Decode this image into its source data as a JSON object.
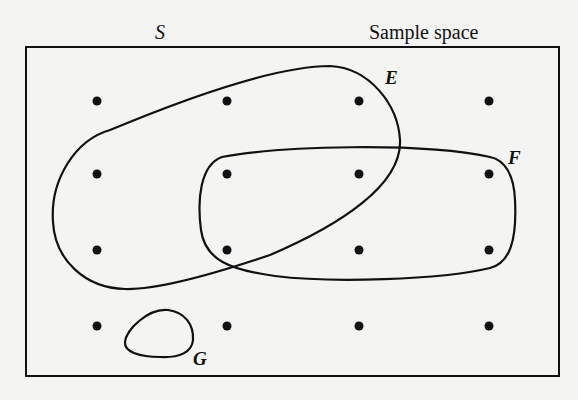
{
  "diagram": {
    "type": "venn",
    "labels": {
      "universe": "S",
      "universe_caption": "Sample space",
      "set_e": "E",
      "set_f": "F",
      "set_g": "G"
    },
    "colors": {
      "background": "#f4f4f2",
      "stroke": "#111111",
      "point": "#111111"
    },
    "grid": {
      "rows": 4,
      "cols": 4,
      "x": [
        97,
        227,
        359,
        489
      ],
      "y": [
        101,
        174,
        250,
        326
      ]
    },
    "points": [
      {
        "row": 0,
        "col": 0,
        "sets": [
          "S"
        ]
      },
      {
        "row": 0,
        "col": 1,
        "sets": [
          "S",
          "E"
        ]
      },
      {
        "row": 0,
        "col": 2,
        "sets": [
          "S",
          "E"
        ]
      },
      {
        "row": 0,
        "col": 3,
        "sets": [
          "S"
        ]
      },
      {
        "row": 1,
        "col": 0,
        "sets": [
          "S",
          "E"
        ]
      },
      {
        "row": 1,
        "col": 1,
        "sets": [
          "S",
          "E",
          "F"
        ]
      },
      {
        "row": 1,
        "col": 2,
        "sets": [
          "S",
          "E",
          "F"
        ]
      },
      {
        "row": 1,
        "col": 3,
        "sets": [
          "S",
          "F"
        ]
      },
      {
        "row": 2,
        "col": 0,
        "sets": [
          "S",
          "E"
        ]
      },
      {
        "row": 2,
        "col": 1,
        "sets": [
          "S",
          "E",
          "F"
        ]
      },
      {
        "row": 2,
        "col": 2,
        "sets": [
          "S",
          "F"
        ]
      },
      {
        "row": 2,
        "col": 3,
        "sets": [
          "S",
          "F"
        ]
      },
      {
        "row": 3,
        "col": 0,
        "sets": [
          "S"
        ]
      },
      {
        "row": 3,
        "col": 1,
        "sets": [
          "S"
        ]
      },
      {
        "row": 3,
        "col": 2,
        "sets": [
          "S"
        ]
      },
      {
        "row": 3,
        "col": 3,
        "sets": [
          "S"
        ]
      }
    ]
  }
}
